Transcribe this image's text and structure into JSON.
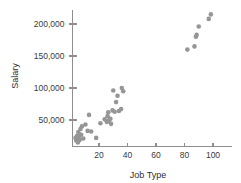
{
  "chart_data": {
    "type": "scatter",
    "title": "",
    "xlabel": "Job Type",
    "ylabel": "Salary",
    "xlim": [
      0,
      105
    ],
    "ylim": [
      0,
      225000
    ],
    "grid": false,
    "legend": null,
    "marker_color": "#969696",
    "axis_color": "#8e8e8e",
    "xticks": [
      20,
      40,
      60,
      80,
      100
    ],
    "xtick_labels": [
      "20",
      "40",
      "60",
      "80",
      "100"
    ],
    "yticks": [
      50000,
      100000,
      150000,
      200000
    ],
    "ytick_labels": [
      "50,000",
      "100,000",
      "150,000",
      "200,000"
    ],
    "points": [
      {
        "x": 3.5,
        "y": 22000
      },
      {
        "x": 4.0,
        "y": 18000
      },
      {
        "x": 4.5,
        "y": 25000
      },
      {
        "x": 5.0,
        "y": 20000
      },
      {
        "x": 5.2,
        "y": 15000
      },
      {
        "x": 5.5,
        "y": 31000
      },
      {
        "x": 6.0,
        "y": 24000
      },
      {
        "x": 6.5,
        "y": 19000
      },
      {
        "x": 7.0,
        "y": 36000
      },
      {
        "x": 7.5,
        "y": 27000
      },
      {
        "x": 8.0,
        "y": 40000
      },
      {
        "x": 9.0,
        "y": 21000
      },
      {
        "x": 10.5,
        "y": 43000
      },
      {
        "x": 12.0,
        "y": 33000
      },
      {
        "x": 13.0,
        "y": 58000
      },
      {
        "x": 14.5,
        "y": 32000
      },
      {
        "x": 18.0,
        "y": 22000
      },
      {
        "x": 21.0,
        "y": 45000
      },
      {
        "x": 24.0,
        "y": 51000
      },
      {
        "x": 25.5,
        "y": 47000
      },
      {
        "x": 26.0,
        "y": 56000
      },
      {
        "x": 26.5,
        "y": 62000
      },
      {
        "x": 27.0,
        "y": 49000
      },
      {
        "x": 28.0,
        "y": 52000
      },
      {
        "x": 28.5,
        "y": 44000
      },
      {
        "x": 29.5,
        "y": 65000
      },
      {
        "x": 30.0,
        "y": 96000
      },
      {
        "x": 31.0,
        "y": 63000
      },
      {
        "x": 32.0,
        "y": 78000
      },
      {
        "x": 33.0,
        "y": 88000
      },
      {
        "x": 34.0,
        "y": 64000
      },
      {
        "x": 35.5,
        "y": 67000
      },
      {
        "x": 36.0,
        "y": 100000
      },
      {
        "x": 37.0,
        "y": 95000
      },
      {
        "x": 82.0,
        "y": 160000
      },
      {
        "x": 87.0,
        "y": 165000
      },
      {
        "x": 88.0,
        "y": 180000
      },
      {
        "x": 88.5,
        "y": 183000
      },
      {
        "x": 90.0,
        "y": 196000
      },
      {
        "x": 97.0,
        "y": 208000
      },
      {
        "x": 98.5,
        "y": 215000
      }
    ]
  }
}
